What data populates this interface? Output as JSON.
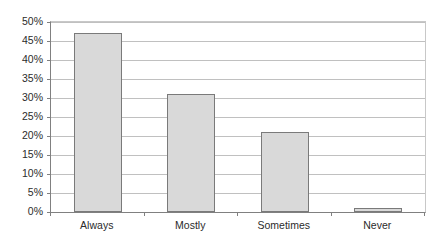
{
  "chart_data": {
    "type": "bar",
    "title": "",
    "subtitle": "",
    "xlabel": "",
    "ylabel": "",
    "categories": [
      "Always",
      "Mostly",
      "Sometimes",
      "Never"
    ],
    "values": [
      47,
      31,
      21,
      1
    ],
    "value_unit": "%",
    "ylim": [
      0,
      50
    ],
    "ytick_step": 5,
    "ytick_labels": [
      "0%",
      "5%",
      "10%",
      "15%",
      "20%",
      "25%",
      "30%",
      "35%",
      "40%",
      "45%",
      "50%"
    ],
    "ytick_values": [
      0,
      5,
      10,
      15,
      20,
      25,
      30,
      35,
      40,
      45,
      50
    ],
    "grid": true,
    "grid_axis": "y",
    "legend": false,
    "legend_position": "none",
    "bar_fill_color": "#d9d9d9",
    "bar_border_color": "#7a7a7a",
    "gridline_color": "#c0c0c0",
    "axis_color": "#808080",
    "background_color": "#ffffff",
    "text_color": "#2b2b2b"
  }
}
